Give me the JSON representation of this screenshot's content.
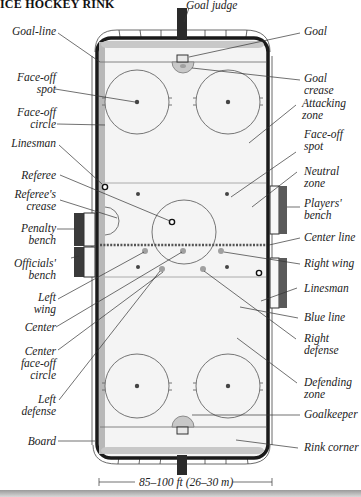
{
  "title": "ICE HOCKEY RINK",
  "labels_left": [
    {
      "key": "goal_line",
      "text": "Goal-line"
    },
    {
      "key": "face_off_spot",
      "text": "Face-off\nspot"
    },
    {
      "key": "face_off_circle",
      "text": "Face-off\ncircle"
    },
    {
      "key": "linesman",
      "text": "Linesman"
    },
    {
      "key": "referee",
      "text": "Referee"
    },
    {
      "key": "referees_crease",
      "text": "Referee's\ncrease"
    },
    {
      "key": "penalty_bench",
      "text": "Penalty\nbench"
    },
    {
      "key": "officials_bench",
      "text": "Officials'\nbench"
    },
    {
      "key": "left_wing",
      "text": "Left\nwing"
    },
    {
      "key": "center",
      "text": "Center"
    },
    {
      "key": "center_face_off_circle",
      "text": "Center\nface-off\ncircle"
    },
    {
      "key": "left_defense",
      "text": "Left\ndefense"
    },
    {
      "key": "board",
      "text": "Board"
    }
  ],
  "labels_right": [
    {
      "key": "goal_judge",
      "text": "Goal judge"
    },
    {
      "key": "goal",
      "text": "Goal"
    },
    {
      "key": "goal_crease",
      "text": "Goal\ncrease"
    },
    {
      "key": "attacking_zone",
      "text": "Attacking\nzone"
    },
    {
      "key": "face_off_spot",
      "text": "Face-off\nspot"
    },
    {
      "key": "neutral_zone",
      "text": "Neutral\nzone"
    },
    {
      "key": "players_bench",
      "text": "Players'\nbench"
    },
    {
      "key": "center_line",
      "text": "Center line"
    },
    {
      "key": "right_wing",
      "text": "Right wing"
    },
    {
      "key": "linesman",
      "text": "Linesman"
    },
    {
      "key": "blue_line",
      "text": "Blue line"
    },
    {
      "key": "right_defense",
      "text": "Right\ndefense"
    },
    {
      "key": "defending_zone",
      "text": "Defending\nzone"
    },
    {
      "key": "goalkeeper",
      "text": "Goalkeeper"
    },
    {
      "key": "rink_corner",
      "text": "Rink corner"
    }
  ],
  "dimension": "85–100 ft (26–30 m)",
  "colors": {
    "ice": "#f4f4f4",
    "board": "#1a1a1a",
    "line": "#888888",
    "player": "#9a9a9a",
    "bench": "#3a3a3a"
  }
}
